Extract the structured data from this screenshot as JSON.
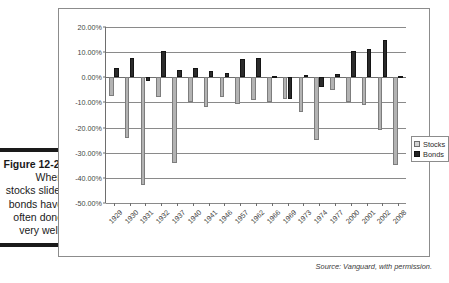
{
  "figure": {
    "number_label": "Figure 12-2:",
    "caption_lines": [
      "When",
      "stocks slide,",
      "bonds have",
      "often done",
      "very well."
    ]
  },
  "source": {
    "text": "Source: Vanguard, with permission."
  },
  "legend": {
    "position": "right",
    "entries": [
      {
        "label": "Stocks",
        "color": "#b3b3b3",
        "swatch": "stocks-swatch-icon"
      },
      {
        "label": "Bonds",
        "color": "#2b2b2b",
        "swatch": "bonds-swatch-icon"
      }
    ]
  },
  "chart_data": {
    "type": "bar",
    "title": "",
    "subtitle": "",
    "xlabel": "",
    "ylabel": "",
    "ylim": [
      -50,
      20
    ],
    "grid": true,
    "legend_position": "right",
    "ytick_labels": [
      "20.00%",
      "10.00%",
      "0.00%",
      "-10.00%",
      "-20.00%",
      "-30.00%",
      "-40.00%",
      "-50.00%"
    ],
    "ytick_values": [
      20,
      10,
      0,
      -10,
      -20,
      -30,
      -40,
      -50
    ],
    "categories": [
      "1929",
      "1930",
      "1931",
      "1932",
      "1937",
      "1940",
      "1941",
      "1946",
      "1957",
      "1962",
      "1966",
      "1969",
      "1973",
      "1974",
      "1977",
      "2000",
      "2001",
      "2002",
      "2008"
    ],
    "series": [
      {
        "name": "Stocks",
        "color": "#b3b3b3",
        "values": [
          -7.5,
          -24.0,
          -43.0,
          -8.0,
          -34.0,
          -10.0,
          -12.0,
          -8.0,
          -10.5,
          -9.0,
          -10.0,
          -8.5,
          -14.0,
          -25.0,
          -5.0,
          -10.0,
          -11.0,
          -21.0,
          -35.0
        ]
      },
      {
        "name": "Bonds",
        "color": "#2b2b2b",
        "values": [
          3.5,
          7.8,
          -1.5,
          10.5,
          2.8,
          3.5,
          2.5,
          1.7,
          7.2,
          7.7,
          0.7,
          -8.5,
          1.1,
          -4.0,
          1.2,
          10.5,
          11.2,
          15.0,
          0.5
        ]
      }
    ]
  }
}
